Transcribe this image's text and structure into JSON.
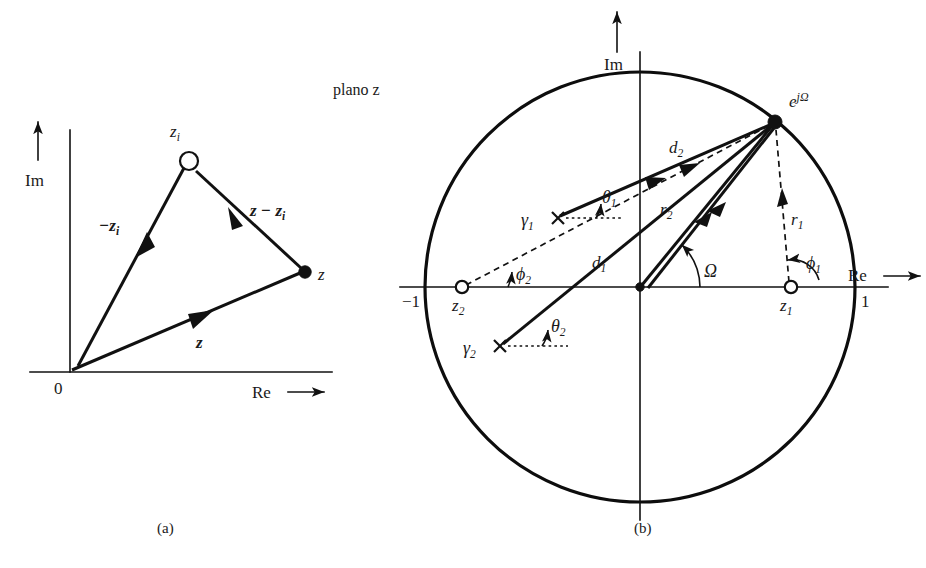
{
  "figure": {
    "title_text": "plano z",
    "panel_a": {
      "caption": "(a)",
      "axis_im_label": "Im",
      "axis_re_label": "Re",
      "axis_re_arrow": "→",
      "origin_label": "0",
      "points": [
        {
          "name": "zero-zi",
          "label": "z",
          "sub": "i",
          "marker": "open-circle"
        },
        {
          "name": "point-z",
          "label": "z",
          "sub": "",
          "marker": "filled-dot"
        }
      ],
      "vectors": [
        {
          "name": "vector-minus-zi",
          "label": "−z",
          "sub": "i",
          "bold": true
        },
        {
          "name": "vector-z-minus-zi",
          "label": "z − z",
          "sub": "i",
          "bold": true
        },
        {
          "name": "vector-z",
          "label": "z",
          "sub": "",
          "bold": true
        }
      ]
    },
    "panel_b": {
      "caption": "(b)",
      "axis_im_label": "Im",
      "axis_re_label": "Re",
      "axis_re_arrow": "→",
      "unit_label_left": "−1",
      "unit_label_right": "1",
      "evaluation_point": {
        "label": "e",
        "exponent": "jΩ",
        "marker": "filled-dot"
      },
      "zeros": [
        {
          "name": "zero-z1",
          "label": "z",
          "sub": "1",
          "marker": "open-circle"
        },
        {
          "name": "zero-z2",
          "label": "z",
          "sub": "2",
          "marker": "open-circle"
        }
      ],
      "poles": [
        {
          "name": "pole-gamma1",
          "label": "γ",
          "sub": "1",
          "marker": "cross"
        },
        {
          "name": "pole-gamma2",
          "label": "γ",
          "sub": "2",
          "marker": "cross"
        }
      ],
      "zero_vectors": [
        {
          "name": "vector-r1",
          "label": "r",
          "sub": "1",
          "style": "dashed"
        },
        {
          "name": "vector-r2",
          "label": "r",
          "sub": "2",
          "style": "solid"
        }
      ],
      "pole_vectors": [
        {
          "name": "vector-d1",
          "label": "d",
          "sub": "1",
          "style": "solid"
        },
        {
          "name": "vector-d2",
          "label": "d",
          "sub": "2",
          "style": "solid"
        }
      ],
      "angles": [
        {
          "name": "angle-phi1",
          "label": "ϕ",
          "sub": "1"
        },
        {
          "name": "angle-phi2",
          "label": "ϕ",
          "sub": "2"
        },
        {
          "name": "angle-theta1",
          "label": "θ",
          "sub": "1"
        },
        {
          "name": "angle-theta2",
          "label": "θ",
          "sub": "2"
        },
        {
          "name": "angle-omega",
          "label": "Ω",
          "sub": ""
        }
      ]
    }
  },
  "colors": {
    "ink": "#111111",
    "background": "#ffffff"
  }
}
